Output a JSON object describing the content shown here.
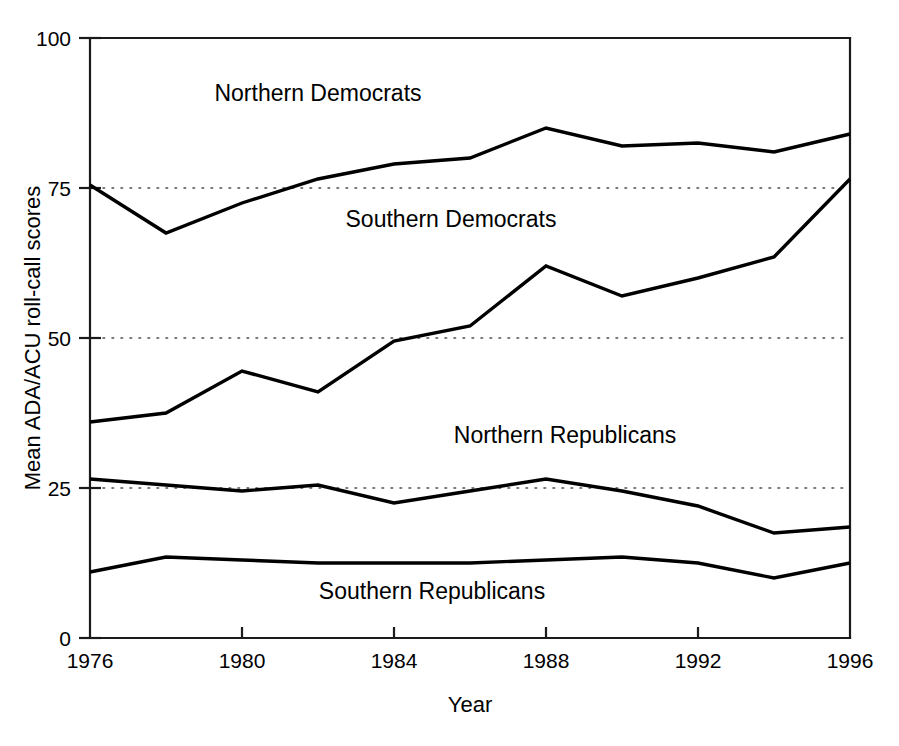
{
  "chart_data": {
    "type": "line",
    "title": "",
    "xlabel": "Year",
    "ylabel": "Mean ADA/ACU roll-call scores",
    "xlim": [
      1976,
      1996
    ],
    "ylim": [
      0,
      100
    ],
    "xticks": [
      1976,
      1980,
      1984,
      1988,
      1992,
      1996
    ],
    "xtick_labels": [
      "1976",
      "1980",
      "1984",
      "1988",
      "1992",
      "1996"
    ],
    "yticks": [
      0,
      25,
      50,
      75,
      100
    ],
    "ytick_labels": [
      "0",
      "25",
      "50",
      "75",
      "100"
    ],
    "grid": "horizontal dotted gridlines at 25, 50, 75",
    "legend_position": "inline labels above each line",
    "x": [
      1976,
      1978,
      1980,
      1982,
      1984,
      1986,
      1988,
      1990,
      1992,
      1994,
      1996
    ],
    "series": [
      {
        "name": "Northern Democrats",
        "label_text": "Northern Democrats",
        "values": [
          75.5,
          67.5,
          72.5,
          76.5,
          79.0,
          80.0,
          85.0,
          82.0,
          82.5,
          81.0,
          84.0
        ]
      },
      {
        "name": "Southern Democrats",
        "label_text": "Southern Democrats",
        "values": [
          36.0,
          37.5,
          44.5,
          41.0,
          49.5,
          52.0,
          62.0,
          57.0,
          60.0,
          63.5,
          76.5
        ]
      },
      {
        "name": "Northern Republicans",
        "label_text": "Northern Republicans",
        "values": [
          26.5,
          25.5,
          24.5,
          25.5,
          22.5,
          24.5,
          26.5,
          24.5,
          22.0,
          17.5,
          18.5
        ]
      },
      {
        "name": "Southern Republicans",
        "label_text": "Southern Republicans",
        "values": [
          11.0,
          13.5,
          13.0,
          12.5,
          12.5,
          12.5,
          13.0,
          13.5,
          12.5,
          10.0,
          12.5
        ]
      }
    ],
    "annotations": [
      {
        "text": "Northern Democrats",
        "x": 1982.0,
        "y": 89.5
      },
      {
        "text": "Southern Democrats",
        "x": 1985.5,
        "y": 68.5
      },
      {
        "text": "Northern Republicans",
        "x": 1988.5,
        "y": 32.5
      },
      {
        "text": "Southern Republicans",
        "x": 1985.0,
        "y": 6.5
      }
    ],
    "colors": {
      "line": "#000000",
      "axis": "#1a1a1a",
      "grid": "#4d4d4d",
      "background": "#ffffff"
    }
  }
}
